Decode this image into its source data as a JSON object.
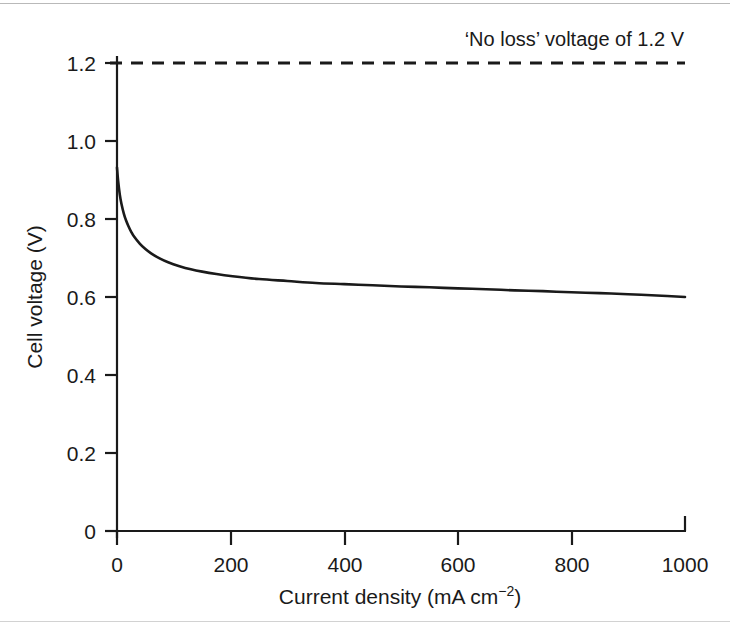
{
  "figure": {
    "background_color": "#ffffff",
    "ink_color": "#1a1a1a"
  },
  "chart_data": {
    "type": "line",
    "title": "",
    "xlabel": "Current density (mA cm",
    "xlabel_superscript": "−2",
    "xlabel_suffix": ")",
    "ylabel": "Cell voltage (V)",
    "xlim": [
      0,
      1000
    ],
    "ylim": [
      0,
      1.2
    ],
    "grid": false,
    "legend": "none",
    "xticks": [
      0,
      200,
      400,
      600,
      800,
      1000
    ],
    "xtick_labels": [
      "0",
      "200",
      "400",
      "600",
      "800",
      "1000"
    ],
    "yticks": [
      0,
      0.2,
      0.4,
      0.6,
      0.8,
      1.0,
      1.2
    ],
    "ytick_labels": [
      "0",
      "0.2",
      "0.4",
      "0.6",
      "0.8",
      "1.0",
      "1.2"
    ],
    "series": [
      {
        "name": "Cell voltage",
        "style": "solid",
        "color": "#1a1a1a",
        "x": [
          0,
          2,
          5,
          8,
          12,
          16,
          20,
          25,
          30,
          40,
          50,
          60,
          75,
          90,
          110,
          130,
          150,
          175,
          200,
          250,
          300,
          350,
          400,
          450,
          500,
          550,
          600,
          650,
          700,
          750,
          800,
          850,
          900,
          950,
          1000
        ],
        "y": [
          0.932,
          0.898,
          0.862,
          0.838,
          0.814,
          0.796,
          0.782,
          0.767,
          0.755,
          0.737,
          0.723,
          0.712,
          0.699,
          0.689,
          0.679,
          0.671,
          0.665,
          0.659,
          0.654,
          0.646,
          0.641,
          0.636,
          0.633,
          0.63,
          0.627,
          0.625,
          0.622,
          0.62,
          0.617,
          0.615,
          0.612,
          0.61,
          0.607,
          0.604,
          0.6
        ]
      },
      {
        "name": "'No loss' voltage",
        "style": "dashed",
        "color": "#1a1a1a",
        "x": [
          0,
          1000
        ],
        "y": [
          1.2,
          1.2
        ]
      }
    ],
    "annotations": [
      {
        "text": "‘No loss’ voltage of 1.2 V",
        "x": 1000,
        "y": 1.2,
        "align": "right",
        "position": "above-line"
      }
    ]
  }
}
